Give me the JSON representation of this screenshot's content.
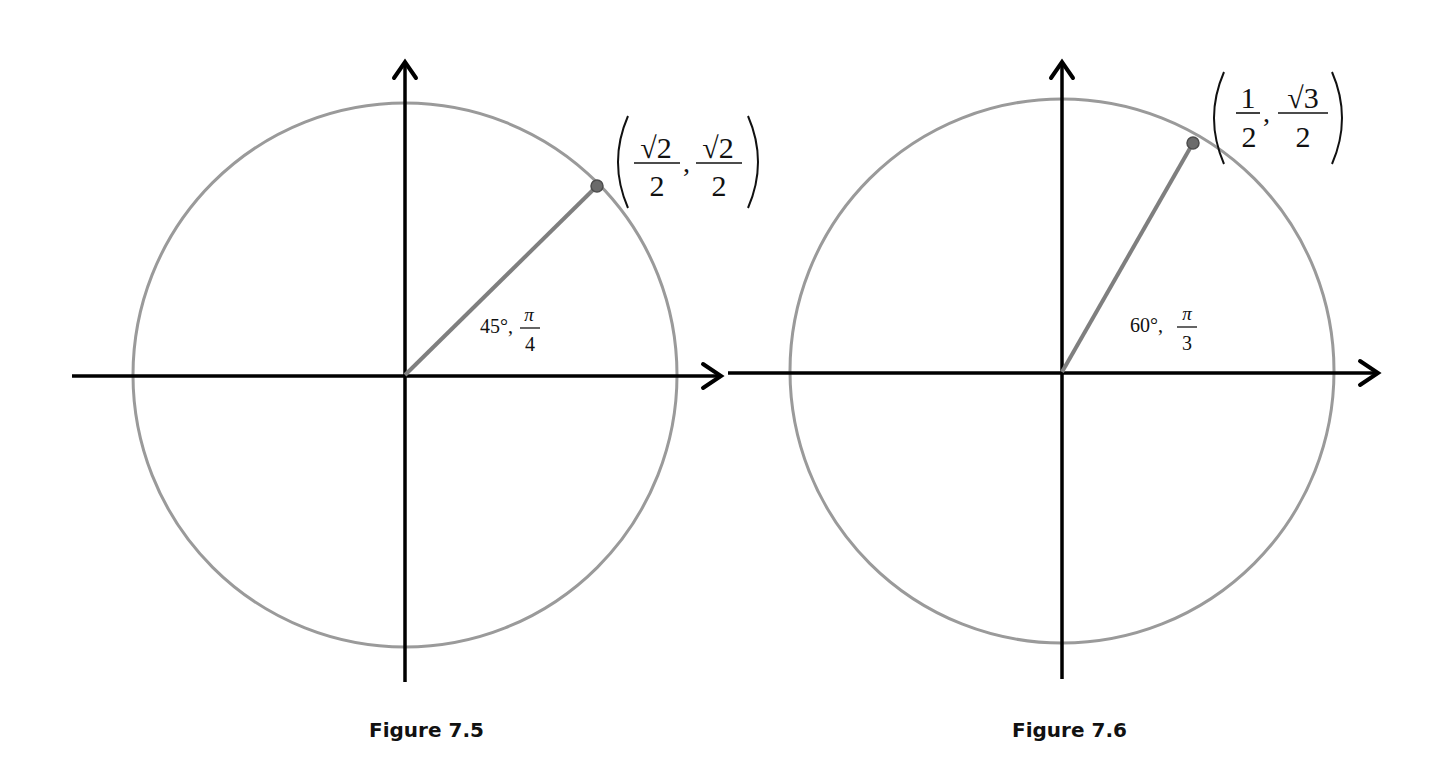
{
  "figures": [
    {
      "caption": "Figure 7.5",
      "angle_degrees": "45°,",
      "angle_radians_num": "π",
      "angle_radians_den": "4",
      "point_x_num": "√2",
      "point_x_den": "2",
      "point_y_num": "√2",
      "point_y_den": "2"
    },
    {
      "caption": "Figure 7.6",
      "angle_degrees": "60°,",
      "angle_radians_num": "π",
      "angle_radians_den": "3",
      "point_x_num": "1",
      "point_x_den": "2",
      "point_y_num": "√3",
      "point_y_den": "2"
    }
  ],
  "colors": {
    "circle": "#9a9a9a",
    "axis": "#000000",
    "radius": "#7f7f7f",
    "point": "#6b6b6b"
  }
}
